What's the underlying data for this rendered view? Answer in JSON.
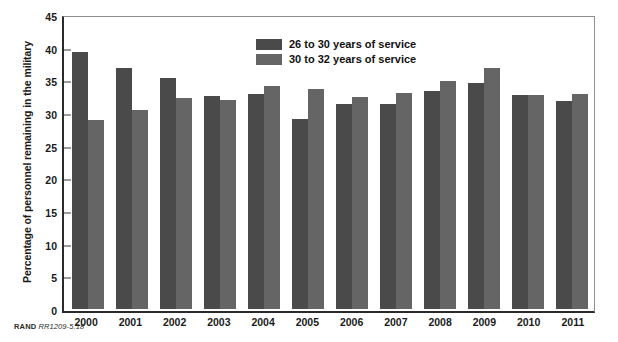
{
  "chart_data": {
    "type": "bar",
    "title": "",
    "xlabel": "",
    "ylabel": "Percentage of personnel remaining in the military",
    "ylim": [
      0,
      45
    ],
    "yticks": [
      0,
      5,
      10,
      15,
      20,
      25,
      30,
      35,
      40,
      45
    ],
    "grid": false,
    "legend_position": "top-center",
    "categories": [
      "2000",
      "2001",
      "2002",
      "2003",
      "2004",
      "2005",
      "2006",
      "2007",
      "2008",
      "2009",
      "2010",
      "2011"
    ],
    "series": [
      {
        "name": "26 to 30 years of service",
        "color": "#4a4a4a",
        "values": [
          39.6,
          37.2,
          35.6,
          32.8,
          33.2,
          29.3,
          31.6,
          31.6,
          33.6,
          34.8,
          33.0,
          32.0
        ]
      },
      {
        "name": "30 to 32 years of service",
        "color": "#656565",
        "values": [
          29.1,
          30.7,
          32.5,
          32.2,
          34.4,
          33.9,
          32.6,
          33.3,
          35.2,
          37.2,
          33.0,
          33.1
        ]
      }
    ]
  },
  "legend": {
    "items": [
      {
        "label": "26 to 30 years of service"
      },
      {
        "label": "30 to 32 years of service"
      }
    ]
  },
  "credit": {
    "org": "RAND",
    "document_id": "RR1209-5.18"
  }
}
